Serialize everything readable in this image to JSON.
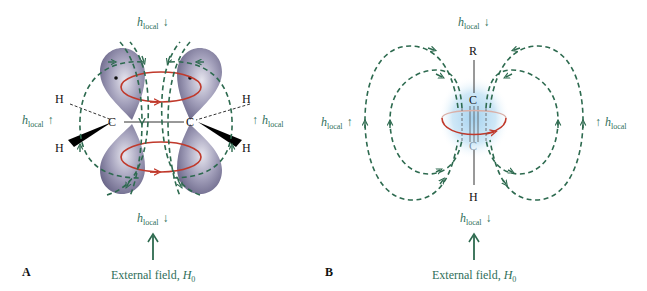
{
  "panels": [
    {
      "id": "A",
      "label": "A",
      "title": "Alkene (sp2 carbons with p orbitals)",
      "atoms": {
        "c_left": "C",
        "c_right": "C",
        "h_upper_left": "H",
        "h_lower_left": "H",
        "h_upper_right": "H",
        "h_lower_right": "H"
      },
      "h_local": {
        "top": "h",
        "top_sub": "local",
        "bottom": "h",
        "bottom_sub": "local",
        "left": "h",
        "left_sub": "local",
        "right": "h",
        "right_sub": "local"
      },
      "arrows": {
        "top": "↓",
        "bottom": "↓",
        "left": "↑",
        "right": "↑"
      },
      "external_field": {
        "text": "External field, ",
        "symbol": "H",
        "sub": "0"
      }
    },
    {
      "id": "B",
      "label": "B",
      "title": "Alkyne (cylindrical pi electron cloud)",
      "atoms": {
        "r_top": "R",
        "c_top": "C",
        "c_bottom": "C",
        "h_bottom": "H"
      },
      "h_local": {
        "top": "h",
        "top_sub": "local",
        "bottom": "h",
        "bottom_sub": "local",
        "left": "h",
        "left_sub": "local",
        "right": "h",
        "right_sub": "local"
      },
      "arrows": {
        "top": "↓",
        "bottom": "↓",
        "left": "↑",
        "right": "↑"
      },
      "external_field": {
        "text": "External field, ",
        "symbol": "H",
        "sub": "0"
      }
    }
  ],
  "colors": {
    "field_lines": "#2d6a4f",
    "label_text": "#2f6f5a",
    "ring_current": "#c0392b",
    "orbital": "#8e8aa8",
    "pi_cloud": "#a8d4ee"
  }
}
